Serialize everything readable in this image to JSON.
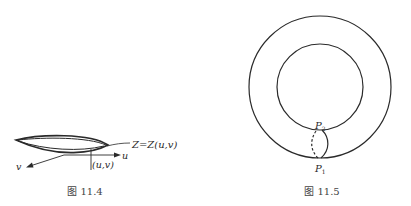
{
  "figures": [
    {
      "id": "fig-11-4",
      "caption": "图 11.4",
      "labels": {
        "surface": "Z=Z(u,v)",
        "point": "(u,v)",
        "u_axis": "u",
        "v_axis": "v"
      }
    },
    {
      "id": "fig-11-5",
      "caption": "图 11.5",
      "labels": {
        "p2": "P",
        "p2_sub": "2",
        "p1": "P",
        "p1_sub": "1"
      }
    }
  ],
  "colors": {
    "line": "#2a2a2a",
    "caption": "#444444",
    "background": "#ffffff"
  }
}
